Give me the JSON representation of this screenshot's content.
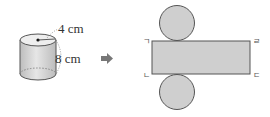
{
  "figure": {
    "cylinder": {
      "radius_label": "4 cm",
      "height_label": "8 cm"
    },
    "arrow": {
      "icon": "right-arrow-icon"
    },
    "net": {
      "corner_labels": {
        "top_left": "ㄱ",
        "bottom_left": "ㄴ",
        "bottom_right": "ㄷ",
        "top_right": "ㄹ"
      }
    },
    "colors": {
      "fill": "#cfcfcf",
      "stroke": "#555555",
      "arrow": "#777777"
    }
  }
}
